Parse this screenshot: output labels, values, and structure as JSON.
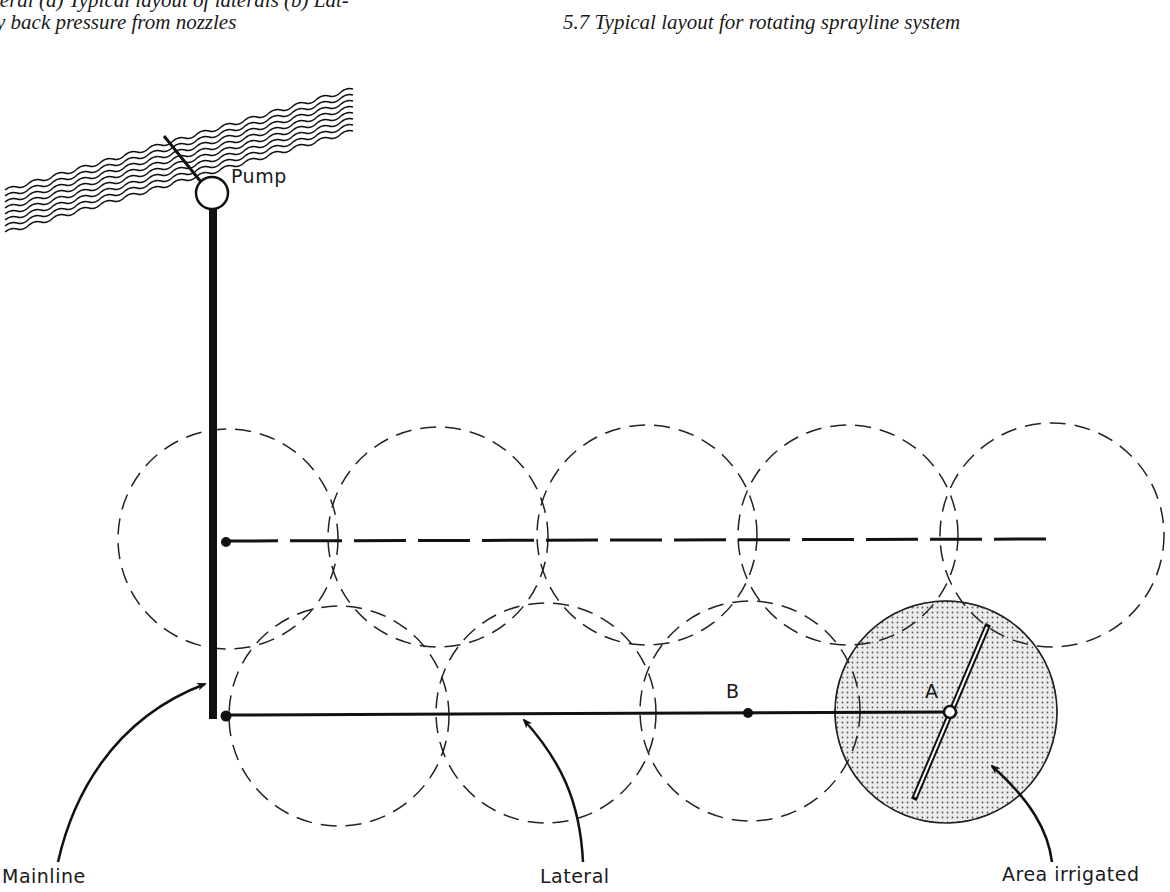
{
  "captions": {
    "left_line1": "teral (a) Typical layout of laterals (b) Lat-",
    "left_line2": "y back pressure from nozzles",
    "right": "5.7   Typical layout for rotating sprayline system"
  },
  "labels": {
    "pump": "Pump",
    "point_a": "A",
    "point_b": "B",
    "mainline": "Mainline",
    "lateral": "Lateral",
    "area_irrigated": "Area irrigated"
  },
  "diagram": {
    "colors": {
      "ink": "#111111",
      "shaded_fill": "#d9d9d9",
      "background": "#ffffff"
    },
    "top_row_circles": [
      {
        "cx": 228,
        "cy": 539,
        "r": 110
      },
      {
        "cx": 438,
        "cy": 537,
        "r": 110
      },
      {
        "cx": 647,
        "cy": 535,
        "r": 110
      },
      {
        "cx": 848,
        "cy": 535,
        "r": 110
      },
      {
        "cx": 1052,
        "cy": 535,
        "r": 112
      }
    ],
    "bottom_row_circles": [
      {
        "cx": 339,
        "cy": 716,
        "r": 110
      },
      {
        "cx": 546,
        "cy": 713,
        "r": 110
      },
      {
        "cx": 750,
        "cy": 711,
        "r": 110
      },
      {
        "cx": 946,
        "cy": 712,
        "r": 111,
        "shaded": true
      }
    ],
    "mainline": {
      "x": 213,
      "y1": 208,
      "y2": 719
    },
    "pump": {
      "cx": 212,
      "cy": 193,
      "r": 16
    },
    "laterals": [
      {
        "name": "upper",
        "y": 541,
        "x1": 226,
        "x2": 1050,
        "style": "dashed"
      },
      {
        "name": "lower",
        "y": 714,
        "x1": 226,
        "x2": 950,
        "style": "solid"
      }
    ],
    "point_b": {
      "x": 748,
      "y": 713
    },
    "point_a": {
      "x": 950,
      "y": 712
    },
    "sprayline": {
      "x1": 987,
      "y1": 627,
      "x2": 915,
      "y2": 797
    }
  }
}
